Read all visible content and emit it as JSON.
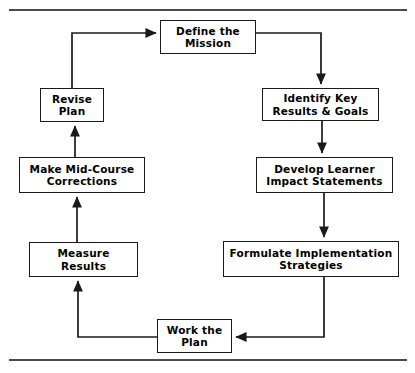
{
  "diagram": {
    "title": "",
    "orientation": "clockwise-cycle",
    "rules": {
      "top_rule": "horizontal-divider",
      "bottom_rule": "horizontal-divider"
    },
    "nodes": [
      {
        "id": "define",
        "label": "Define the\nMission",
        "name": "node-define-the-mission"
      },
      {
        "id": "identify",
        "label": "Identify Key\nResults & Goals",
        "name": "node-identify-key-results-goals"
      },
      {
        "id": "develop",
        "label": "Develop Learner\nImpact Statements",
        "name": "node-develop-learner-impact-statements"
      },
      {
        "id": "formulate",
        "label": "Formulate Implementation\nStrategies",
        "name": "node-formulate-implementation-strategies"
      },
      {
        "id": "work",
        "label": "Work the\nPlan",
        "name": "node-work-the-plan"
      },
      {
        "id": "measure",
        "label": "Measure\nResults",
        "name": "node-measure-results"
      },
      {
        "id": "make",
        "label": "Make Mid-Course\nCorrections",
        "name": "node-make-mid-course-corrections"
      },
      {
        "id": "revise",
        "label": "Revise\nPlan",
        "name": "node-revise-plan"
      }
    ],
    "edges": [
      {
        "from": "define",
        "to": "identify",
        "style": "elbow-right-down"
      },
      {
        "from": "identify",
        "to": "develop",
        "style": "straight-down"
      },
      {
        "from": "develop",
        "to": "formulate",
        "style": "straight-down"
      },
      {
        "from": "formulate",
        "to": "work",
        "style": "elbow-down-left"
      },
      {
        "from": "work",
        "to": "measure",
        "style": "elbow-left-up"
      },
      {
        "from": "measure",
        "to": "make",
        "style": "straight-up"
      },
      {
        "from": "make",
        "to": "revise",
        "style": "straight-up"
      },
      {
        "from": "revise",
        "to": "define",
        "style": "elbow-up-right"
      }
    ],
    "colors": {
      "stroke": "#1a1a1a",
      "rule": "#4a4a4a",
      "box_fill": "#ffffff",
      "text": "#000000"
    }
  }
}
